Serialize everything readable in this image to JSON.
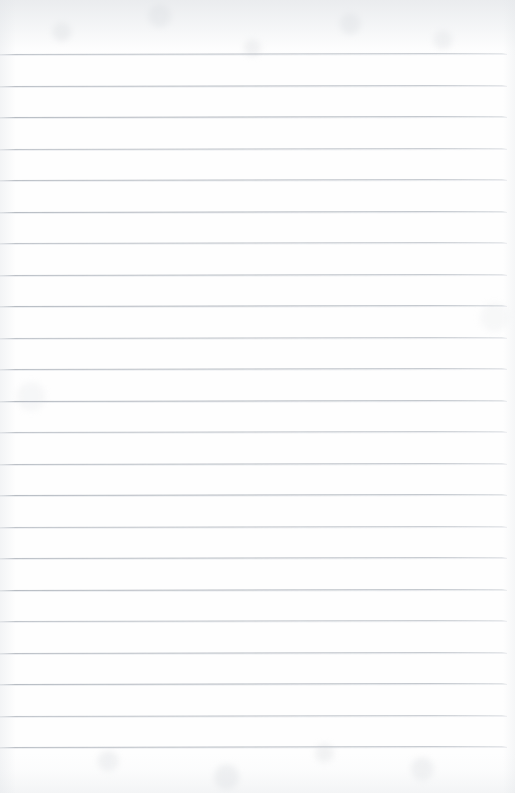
{
  "document": {
    "kind": "scanned-lined-paper",
    "title": "Blank ruled notepad page",
    "content_text": "",
    "page_width": 515,
    "page_height": 793,
    "background_color": "#fefefe",
    "rule_color": "#a8aeb6",
    "texture_color": "#d0d4d8"
  },
  "ruling": {
    "line_count": 23,
    "first_line_y": 54,
    "line_spacing": 31.5,
    "line_thickness": 1,
    "line_start_x": 0,
    "line_end_x": 507,
    "skew_degrees": -0.12,
    "lines_y": [
      54,
      85.5,
      117,
      148.5,
      180,
      211.5,
      243,
      274.5,
      306,
      337.5,
      369,
      400.5,
      432,
      463.5,
      495,
      526.5,
      558,
      589.5,
      621,
      652.5,
      684,
      715.5,
      747
    ]
  },
  "margins": {
    "top_margin_height": 54,
    "bottom_margin_height": 38,
    "right_margin_width": 8,
    "left_margin_width": 0,
    "vertical_margin_rule": false
  }
}
